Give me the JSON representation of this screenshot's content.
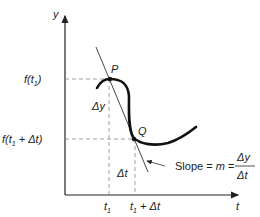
{
  "diagram": {
    "y_axis_label": "y",
    "x_axis_label": "t",
    "point_p_label": "P",
    "point_q_label": "Q",
    "y_tick_1": "f(t",
    "y_tick_1_sub": "1",
    "y_tick_1_close": ")",
    "y_tick_2": "f(t",
    "y_tick_2_sub": "1",
    "y_tick_2_rest": " + Δt)",
    "x_tick_1": "t",
    "x_tick_1_sub": "1",
    "x_tick_2": "t",
    "x_tick_2_sub": "1",
    "x_tick_2_rest": " + Δt",
    "delta_y_label": "Δy",
    "delta_t_label": "Δt",
    "slope_text": "Slope = ",
    "slope_m": "m",
    "slope_eq": " =",
    "slope_num": "Δy",
    "slope_den": "Δt",
    "colors": {
      "line": "#222222",
      "dashed": "#888888"
    }
  }
}
